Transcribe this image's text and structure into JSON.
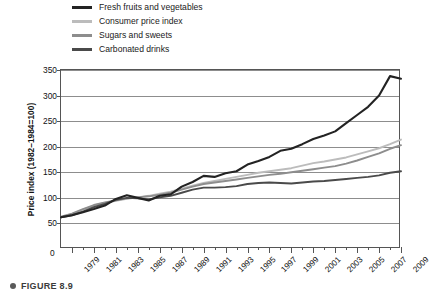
{
  "figure": {
    "bullet_icon": "bullet-icon",
    "caption": "FIGURE 8.9"
  },
  "legend": {
    "position": "above-plot",
    "items": [
      {
        "label": "Fresh fruits and vegetables",
        "color": "#232323"
      },
      {
        "label": "Consumer price index",
        "color": "#bcbcbc"
      },
      {
        "label": "Sugars and sweets",
        "color": "#8d8d8d"
      },
      {
        "label": "Carbonated drinks",
        "color": "#4a4a4a"
      }
    ]
  },
  "chart_data": {
    "type": "line",
    "title": "",
    "subtitle": "",
    "xlabel": "",
    "ylabel": "Price index (1982–1984=100)",
    "grid": true,
    "xlim": [
      1978,
      2009
    ],
    "ylim": [
      0,
      350
    ],
    "yticks": [
      50,
      100,
      150,
      200,
      250,
      300,
      350
    ],
    "origin_label": "0",
    "xticks": [
      1979,
      1981,
      1983,
      1985,
      1987,
      1989,
      1991,
      1993,
      1995,
      1997,
      1999,
      2001,
      2003,
      2005,
      2007,
      2009
    ],
    "xtick_labels": [
      "1979",
      "1981",
      "1983",
      "1985",
      "1987",
      "1989",
      "1991",
      "1993",
      "1995",
      "1997",
      "1999",
      "2001",
      "2003",
      "2005",
      "2007",
      "2009"
    ],
    "x": [
      1978,
      1979,
      1980,
      1981,
      1982,
      1983,
      1984,
      1985,
      1986,
      1987,
      1988,
      1989,
      1990,
      1991,
      1992,
      1993,
      1994,
      1995,
      1996,
      1997,
      1998,
      1999,
      2000,
      2001,
      2002,
      2003,
      2004,
      2005,
      2006,
      2007,
      2008,
      2009
    ],
    "series": [
      {
        "name": "Fresh fruits and vegetables",
        "color": "#232323",
        "values": [
          62,
          66,
          72,
          78,
          85,
          98,
          105,
          100,
          95,
          104,
          107,
          122,
          131,
          143,
          141,
          148,
          152,
          165,
          172,
          180,
          192,
          196,
          205,
          215,
          222,
          230,
          246,
          262,
          278,
          300,
          338,
          333
        ]
      },
      {
        "name": "Consumer price index",
        "color": "#bcbcbc",
        "values": [
          62,
          68,
          77,
          85,
          90,
          94,
          98,
          101,
          104,
          108,
          112,
          118,
          124,
          129,
          133,
          137,
          141,
          145,
          149,
          152,
          155,
          158,
          163,
          168,
          171,
          175,
          179,
          185,
          191,
          197,
          205,
          214
        ]
      },
      {
        "name": "Sugars and sweets",
        "color": "#8d8d8d",
        "values": [
          63,
          69,
          78,
          86,
          91,
          95,
          99,
          101,
          103,
          106,
          110,
          116,
          122,
          127,
          130,
          133,
          136,
          139,
          142,
          145,
          147,
          150,
          153,
          156,
          159,
          162,
          167,
          173,
          180,
          187,
          196,
          203
        ]
      },
      {
        "name": "Carbonated drinks",
        "color": "#4a4a4a",
        "values": [
          62,
          66,
          73,
          82,
          88,
          96,
          100,
          99,
          97,
          101,
          104,
          110,
          116,
          120,
          120,
          121,
          123,
          127,
          129,
          130,
          129,
          128,
          130,
          132,
          133,
          135,
          137,
          139,
          141,
          144,
          149,
          152
        ]
      }
    ]
  }
}
